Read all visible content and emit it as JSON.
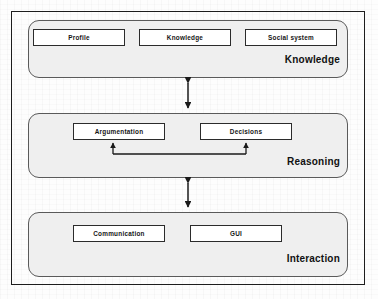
{
  "diagram": {
    "frame": {
      "border_color": "#1d1d1d"
    },
    "panel_fill": "#efefef",
    "box_fill": "#ffffff",
    "line_color": "#1a1a1a",
    "layers": [
      {
        "id": "knowledge",
        "title": "Knowledge",
        "boxes": [
          {
            "id": "profile",
            "label": "Profile"
          },
          {
            "id": "knowledge",
            "label": "Knowledge"
          },
          {
            "id": "social-system",
            "label": "Social system"
          }
        ]
      },
      {
        "id": "reasoning",
        "title": "Reasoning",
        "boxes": [
          {
            "id": "argumentation",
            "label": "Argumentation"
          },
          {
            "id": "decisions",
            "label": "Decisions"
          }
        ]
      },
      {
        "id": "interaction",
        "title": "Interaction",
        "boxes": [
          {
            "id": "communication",
            "label": "Communication"
          },
          {
            "id": "gui",
            "label": "GUI"
          }
        ]
      }
    ],
    "connectors": [
      {
        "id": "knowledge-reasoning",
        "type": "double-arrow-vertical",
        "from": "knowledge",
        "to": "reasoning"
      },
      {
        "id": "reasoning-interaction",
        "type": "double-arrow-vertical",
        "from": "reasoning",
        "to": "interaction"
      },
      {
        "id": "decisions-argumentation-feedback",
        "type": "u-shaped-double-arrow",
        "from": "decisions",
        "to": "argumentation"
      }
    ]
  }
}
